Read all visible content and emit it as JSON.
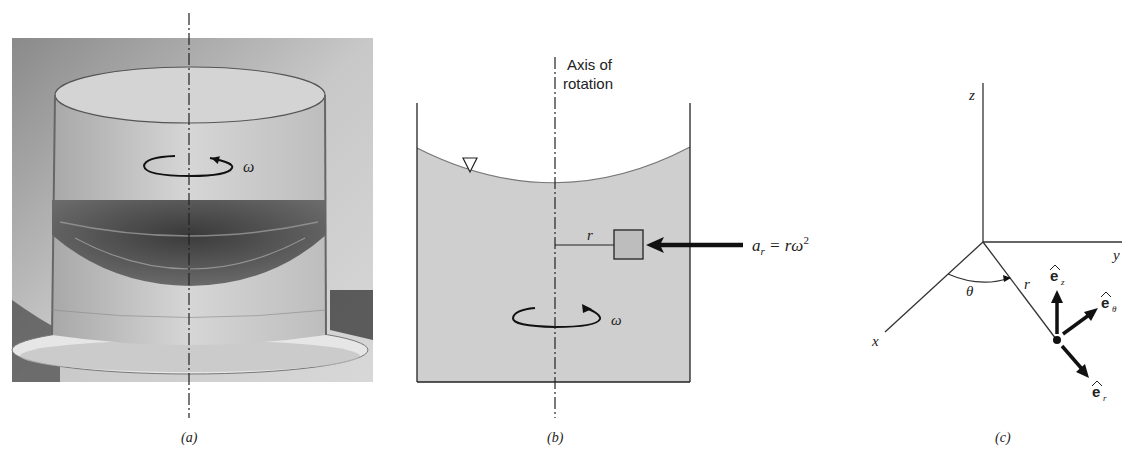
{
  "panels": {
    "a": {
      "caption": "(a)",
      "omega_label": "ω",
      "description": "Photograph of a rotating glass cylinder with water forming a paraboloid free surface"
    },
    "b": {
      "caption": "(b)",
      "axis_label_line1": "Axis of",
      "axis_label_line2": "rotation",
      "radius_label": "r",
      "omega_label": "ω",
      "accel_label_a": "a",
      "accel_label_sub": "r",
      "accel_label_eq": " = rω",
      "accel_label_sup": "2",
      "free_surface_symbol": "▽"
    },
    "c": {
      "caption": "(c)",
      "z_label": "z",
      "y_label": "y",
      "x_label": "x",
      "theta_label": "θ",
      "r_label": "r",
      "ez_label": "e",
      "ez_sub": "z",
      "etheta_label": "e",
      "etheta_sub": "θ",
      "er_label": "e",
      "er_sub": "r",
      "hat": "^"
    }
  },
  "colors": {
    "fluid_fill": "#cfcfcf",
    "line": "#222222",
    "photo_bg": "#9a9a9a"
  }
}
